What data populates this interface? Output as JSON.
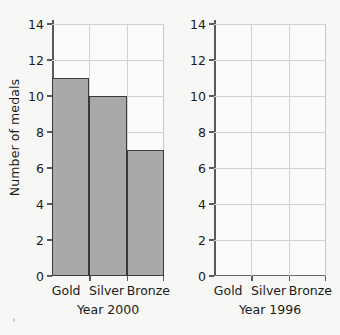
{
  "chart_data": [
    {
      "type": "bar",
      "title": "Year 2000",
      "categories": [
        "Gold",
        "Silver",
        "Bronze"
      ],
      "values": [
        11,
        10,
        7
      ],
      "xlabel": "Year 2000",
      "ylabel": "Number of medals",
      "ylim": [
        0,
        14
      ],
      "ytick_step": 2,
      "yticks": [
        0,
        2,
        4,
        6,
        8,
        10,
        12,
        14
      ],
      "ytick_labels": [
        "0",
        "2",
        "4",
        "6",
        "8",
        "10",
        "12",
        "14"
      ],
      "grid": true,
      "legend": false,
      "bar_fill": "#a9a9a9",
      "bar_edge": "#3a3a3a"
    },
    {
      "type": "bar",
      "title": "Year 1996",
      "categories": [
        "Gold",
        "Silver",
        "Bronze"
      ],
      "values": [
        null,
        null,
        null
      ],
      "xlabel": "Year 1996",
      "ylabel": "",
      "ylim": [
        0,
        14
      ],
      "ytick_step": 2,
      "yticks": [
        0,
        2,
        4,
        6,
        8,
        10,
        12,
        14
      ],
      "ytick_labels": [
        "0",
        "2",
        "4",
        "6",
        "8",
        "10",
        "12",
        "14"
      ],
      "grid": true,
      "legend": false,
      "empty": true
    }
  ],
  "left_panel": {
    "axis_title": "Number of medals",
    "caption": "Year 2000",
    "categories": [
      {
        "label": "Gold",
        "value": 11
      },
      {
        "label": "Silver",
        "value": 10
      },
      {
        "label": "Bronze",
        "value": 7
      }
    ],
    "ytick_labels": [
      "14",
      "12",
      "10",
      "8",
      "6",
      "4",
      "2",
      "0"
    ]
  },
  "right_panel": {
    "axis_title": "",
    "caption": "Year 1996",
    "categories": [
      {
        "label": "Gold",
        "value": null
      },
      {
        "label": "Silver",
        "value": null
      },
      {
        "label": "Bronze",
        "value": null
      }
    ],
    "ytick_labels": [
      "14",
      "12",
      "10",
      "8",
      "6",
      "4",
      "2",
      "0"
    ]
  },
  "colors": {
    "background": "#f7f7f5",
    "plot_background": "#fbfbfa",
    "gridline": "#d2d2d2",
    "axis": "#5a5a5a",
    "text": "#1a1a1a",
    "bar_fill": "#a9a9a9",
    "bar_edge": "#3a3a3a"
  }
}
